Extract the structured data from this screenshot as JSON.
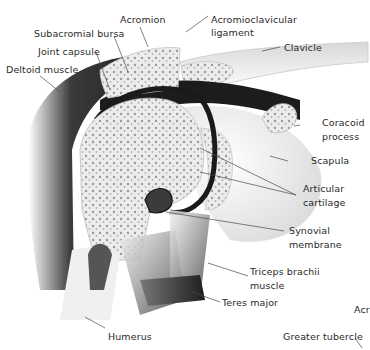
{
  "diagram": {
    "colors": {
      "bone_fill": "#e9e9e9",
      "bone_pores": "#8a8a8a",
      "dark_space": "#1c1c1c",
      "muscle_dark": "#2e2e2e",
      "cartilage": "#f2f2f2",
      "text": "#2a2a2a",
      "leader_line": "#4a4a4a"
    },
    "labels": {
      "acromion": "Acromion",
      "acromioclavicular_1": "Acromioclavicular",
      "acromioclavicular_2": "ligament",
      "subacromial_bursa": "Subacromial bursa",
      "joint_capsule": "Joint capsule",
      "deltoid_muscle": "Deltoid muscle",
      "clavicle": "Clavicle",
      "coracoid_1": "Coracoid",
      "coracoid_2": "process",
      "scapula": "Scapula",
      "articular_1": "Articular",
      "articular_2": "cartilage",
      "synovial_1": "Synovial",
      "synovial_2": "membrane",
      "triceps_1": "Triceps brachii",
      "triceps_2": "muscle",
      "teres_major": "Teres major",
      "humerus": "Humerus",
      "partial_acro": "Acr",
      "greater_tubercle": "Greater tubercle"
    }
  }
}
